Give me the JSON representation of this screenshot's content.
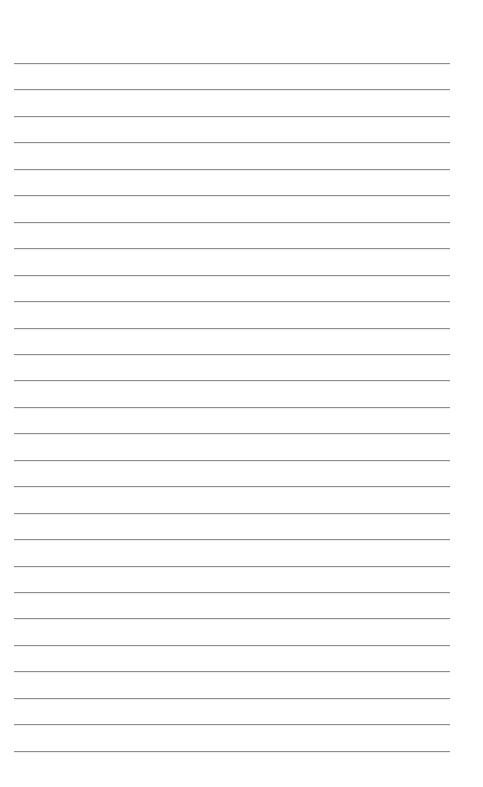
{
  "page": {
    "type": "lined-paper",
    "background": "#ffffff",
    "line_color": "#8e8e8e",
    "line_count": 27,
    "line_left": 14,
    "line_right": 450,
    "first_line_y": 63,
    "line_spacing": 26.45,
    "text": []
  }
}
